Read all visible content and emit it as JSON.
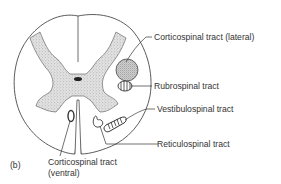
{
  "figure": {
    "panel_label": "(b)"
  },
  "labels": {
    "corticospinal_lateral": "Corticospinal tract (lateral)",
    "rubrospinal": "Rubrospinal tract",
    "vestibulospinal": "Vestibulospinal tract",
    "reticulospinal": "Reticulospinal tract",
    "corticospinal_ventral_line1": "Corticospinal tract",
    "corticospinal_ventral_line2": "(ventral)"
  },
  "colors": {
    "outline": "#4a4a4a",
    "grey_matter_fill": "#d9d9d9",
    "stipple": "#8a8a8a",
    "background": "#ffffff"
  }
}
